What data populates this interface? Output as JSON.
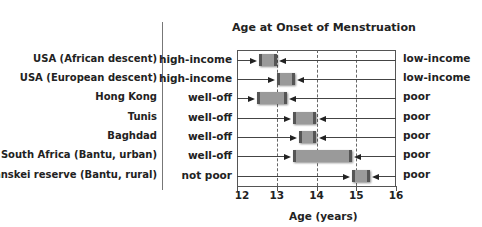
{
  "chart_data": {
    "type": "range-bar",
    "title": "Age at Onset of Menstruation",
    "xlabel": "Age (years)",
    "ylabel": "",
    "xlim": [
      12,
      16
    ],
    "xticks": [
      "12",
      "13",
      "14",
      "15",
      "16"
    ],
    "grid": "vertical dashed at 13, 14, 15",
    "left_labels": "population",
    "middle_labels": "well-off group (arrow from left points to lower end)",
    "right_labels": "poor group (arrow from right points to upper end)",
    "rows": [
      {
        "population": "USA (African descent)",
        "rich_label": "high-income",
        "poor_label": "low-income",
        "low": 12.55,
        "high": 13.0
      },
      {
        "population": "USA (European descent)",
        "rich_label": "high-income",
        "poor_label": "low-income",
        "low": 13.0,
        "high": 13.45
      },
      {
        "population": "Hong Kong",
        "rich_label": "well-off",
        "poor_label": "poor",
        "low": 12.5,
        "high": 13.25
      },
      {
        "population": "Tunis",
        "rich_label": "well-off",
        "poor_label": "poor",
        "low": 13.4,
        "high": 14.0
      },
      {
        "population": "Baghdad",
        "rich_label": "well-off",
        "poor_label": "poor",
        "low": 13.55,
        "high": 14.0
      },
      {
        "population": "South Africa (Bantu, urban)",
        "rich_label": "well-off",
        "poor_label": "poor",
        "low": 13.4,
        "high": 14.9
      },
      {
        "population": "Transkei reserve (Bantu, rural)",
        "rich_label": "not poor",
        "poor_label": "poor",
        "low": 14.9,
        "high": 15.35
      }
    ]
  },
  "colors": {
    "box_fill": "#9a9a9a",
    "box_edge": "#555555",
    "text": "#222222"
  }
}
